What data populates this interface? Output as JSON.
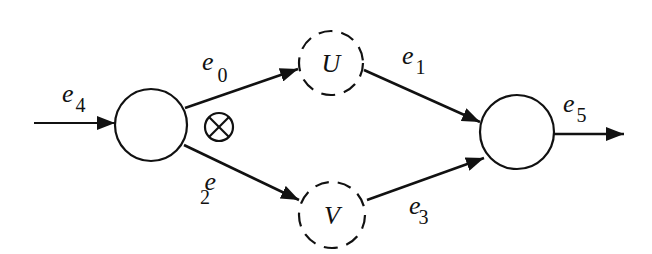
{
  "diagram": {
    "type": "directed-network",
    "nodes": [
      {
        "id": "source",
        "label": "",
        "style": "solid",
        "cx": 151,
        "cy": 125,
        "r": 36
      },
      {
        "id": "U",
        "label": "U",
        "style": "dashed",
        "cx": 331,
        "cy": 63,
        "r": 32
      },
      {
        "id": "V",
        "label": "V",
        "style": "dashed",
        "cx": 332,
        "cy": 215,
        "r": 33
      },
      {
        "id": "sink",
        "label": "",
        "style": "solid",
        "cx": 517,
        "cy": 132,
        "r": 37
      }
    ],
    "edges": [
      {
        "id": "e4",
        "base": "e",
        "sub": "4",
        "from": "input",
        "to": "source"
      },
      {
        "id": "e0",
        "base": "e",
        "sub": "0",
        "from": "source",
        "to": "U"
      },
      {
        "id": "e2",
        "base": "e",
        "sub": "2",
        "from": "source",
        "to": "V"
      },
      {
        "id": "e1",
        "base": "e",
        "sub": "1",
        "from": "U",
        "to": "sink"
      },
      {
        "id": "e3",
        "base": "e",
        "sub": "3",
        "from": "V",
        "to": "sink"
      },
      {
        "id": "e5",
        "base": "e",
        "sub": "5",
        "from": "sink",
        "to": "output"
      }
    ],
    "operator_symbol": "⊗",
    "stroke_color": "#111111",
    "background_color": "#ffffff"
  }
}
